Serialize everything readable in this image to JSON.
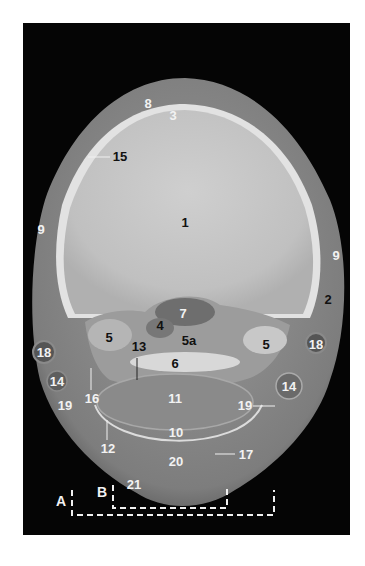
{
  "figure": {
    "background": "#050505",
    "labels": [
      {
        "text": "8",
        "x": 148,
        "y": 103,
        "color": "white"
      },
      {
        "text": "3",
        "x": 173,
        "y": 115,
        "color": "white"
      },
      {
        "text": "15",
        "x": 120,
        "y": 156,
        "color": "black"
      },
      {
        "text": "1",
        "x": 185,
        "y": 222,
        "color": "black"
      },
      {
        "text": "9",
        "x": 41,
        "y": 229,
        "color": "white"
      },
      {
        "text": "9",
        "x": 336,
        "y": 255,
        "color": "white"
      },
      {
        "text": "2",
        "x": 328,
        "y": 299,
        "color": "black"
      },
      {
        "text": "7",
        "x": 183,
        "y": 313,
        "color": "white"
      },
      {
        "text": "4",
        "x": 160,
        "y": 325,
        "color": "black"
      },
      {
        "text": "5",
        "x": 109,
        "y": 337,
        "color": "black"
      },
      {
        "text": "5a",
        "x": 189,
        "y": 340,
        "color": "black"
      },
      {
        "text": "13",
        "x": 139,
        "y": 346,
        "color": "black"
      },
      {
        "text": "5",
        "x": 266,
        "y": 344,
        "color": "black"
      },
      {
        "text": "18",
        "x": 44,
        "y": 352,
        "color": "white"
      },
      {
        "text": "18",
        "x": 316,
        "y": 344,
        "color": "white"
      },
      {
        "text": "6",
        "x": 175,
        "y": 363,
        "color": "black"
      },
      {
        "text": "14",
        "x": 57,
        "y": 381,
        "color": "white"
      },
      {
        "text": "14",
        "x": 289,
        "y": 386,
        "color": "white"
      },
      {
        "text": "16",
        "x": 92,
        "y": 398,
        "color": "white"
      },
      {
        "text": "11",
        "x": 175,
        "y": 398,
        "color": "white"
      },
      {
        "text": "19",
        "x": 65,
        "y": 405,
        "color": "white"
      },
      {
        "text": "19",
        "x": 245,
        "y": 405,
        "color": "white"
      },
      {
        "text": "10",
        "x": 176,
        "y": 432,
        "color": "white"
      },
      {
        "text": "12",
        "x": 108,
        "y": 448,
        "color": "white"
      },
      {
        "text": "17",
        "x": 246,
        "y": 454,
        "color": "white"
      },
      {
        "text": "20",
        "x": 176,
        "y": 461,
        "color": "white"
      },
      {
        "text": "21",
        "x": 134,
        "y": 484,
        "color": "white"
      }
    ],
    "brackets": [
      {
        "letter": "A",
        "letter_x": 61,
        "letter_y": 501
      },
      {
        "letter": "B",
        "letter_x": 102,
        "letter_y": 492
      }
    ]
  }
}
